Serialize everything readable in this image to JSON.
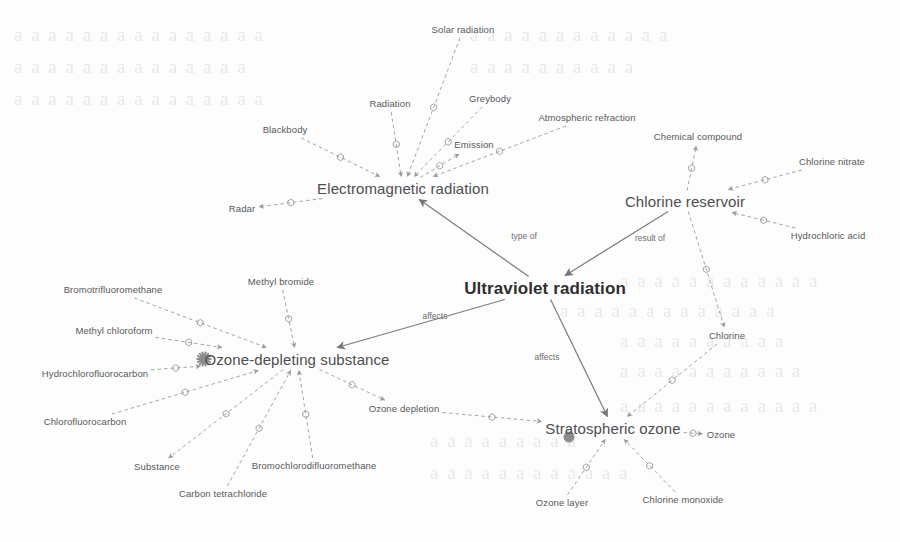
{
  "canvas": {
    "width": 900,
    "height": 542,
    "background": "#fdfdfd"
  },
  "palette": {
    "edge": "#9a9a9c",
    "edge_solid": "#7d7d80",
    "node_text": "#58585a",
    "hub_text": "#2f2f31",
    "edge_label": "#6d6d70",
    "hub_marker": "#8c8c8e",
    "bleed_text": "#b9b6b2"
  },
  "graph": {
    "type": "concept-map",
    "nodes": [
      {
        "id": "solar-radiation",
        "label": "Solar radiation",
        "x": 463,
        "y": 30,
        "tier": "small"
      },
      {
        "id": "radiation",
        "label": "Radiation",
        "x": 390,
        "y": 104,
        "tier": "small"
      },
      {
        "id": "greybody",
        "label": "Greybody",
        "x": 490,
        "y": 99,
        "tier": "small"
      },
      {
        "id": "blackbody",
        "label": "Blackbody",
        "x": 285,
        "y": 130,
        "tier": "small"
      },
      {
        "id": "emission",
        "label": "Emission",
        "x": 474,
        "y": 145,
        "tier": "small"
      },
      {
        "id": "atmospheric-refraction",
        "label": "Atmospheric refraction",
        "x": 587,
        "y": 118,
        "tier": "small"
      },
      {
        "id": "chemical-compound",
        "label": "Chemical compound",
        "x": 698,
        "y": 137,
        "tier": "small"
      },
      {
        "id": "chlorine-nitrate",
        "label": "Chlorine nitrate",
        "x": 832,
        "y": 162,
        "tier": "small"
      },
      {
        "id": "hydrochloric-acid",
        "label": "Hydrochloric acid",
        "x": 828,
        "y": 236,
        "tier": "small"
      },
      {
        "id": "radar",
        "label": "Radar",
        "x": 242,
        "y": 209,
        "tier": "small"
      },
      {
        "id": "electromagnetic-radiation",
        "label": "Electromagnetic radiation",
        "x": 403,
        "y": 188,
        "tier": "main"
      },
      {
        "id": "chlorine-reservoir",
        "label": "Chlorine reservoir",
        "x": 685,
        "y": 201,
        "tier": "main"
      },
      {
        "id": "ultraviolet-radiation",
        "label": "Ultraviolet radiation",
        "x": 545,
        "y": 288,
        "tier": "hub"
      },
      {
        "id": "bromotrifluoromethane",
        "label": "Bromotrifluoromethane",
        "x": 113,
        "y": 290,
        "tier": "small"
      },
      {
        "id": "methyl-bromide",
        "label": "Methyl bromide",
        "x": 281,
        "y": 282,
        "tier": "small"
      },
      {
        "id": "methyl-chloroform",
        "label": "Methyl chloroform",
        "x": 114,
        "y": 331,
        "tier": "small"
      },
      {
        "id": "hydrochlorofluorocarbon",
        "label": "Hydrochlorofluorocarbon",
        "x": 95,
        "y": 374,
        "tier": "small"
      },
      {
        "id": "chlorofluorocarbon",
        "label": "Chlorofluorocarbon",
        "x": 85,
        "y": 422,
        "tier": "small"
      },
      {
        "id": "ozone-depleting-substance",
        "label": "Ozone-depleting substance",
        "x": 297,
        "y": 359,
        "tier": "main"
      },
      {
        "id": "chlorine",
        "label": "Chlorine",
        "x": 727,
        "y": 336,
        "tier": "small"
      },
      {
        "id": "substance",
        "label": "Substance",
        "x": 157,
        "y": 467,
        "tier": "small"
      },
      {
        "id": "carbon-tetrachloride",
        "label": "Carbon tetrachloride",
        "x": 223,
        "y": 494,
        "tier": "small"
      },
      {
        "id": "bromochlorodifluoromethane",
        "label": "Bromochlorodifluoromethane",
        "x": 314,
        "y": 466,
        "tier": "small"
      },
      {
        "id": "ozone-depletion",
        "label": "Ozone depletion",
        "x": 404,
        "y": 409,
        "tier": "small"
      },
      {
        "id": "stratospheric-ozone",
        "label": "Stratospheric ozone",
        "x": 613,
        "y": 428,
        "tier": "main"
      },
      {
        "id": "ozone",
        "label": "Ozone",
        "x": 721,
        "y": 435,
        "tier": "small"
      },
      {
        "id": "ozone-layer",
        "label": "Ozone layer",
        "x": 562,
        "y": 503,
        "tier": "small"
      },
      {
        "id": "chlorine-monoxide",
        "label": "Chlorine monoxide",
        "x": 683,
        "y": 500,
        "tier": "small"
      }
    ],
    "edge_labels": [
      {
        "id": "type-of",
        "label": "type of",
        "x": 524,
        "y": 236
      },
      {
        "id": "result-of",
        "label": "result of",
        "x": 650,
        "y": 238
      },
      {
        "id": "affects-ods",
        "label": "affects",
        "x": 435,
        "y": 316
      },
      {
        "id": "affects-ozone",
        "label": "affects",
        "x": 547,
        "y": 357
      }
    ],
    "edges": [
      {
        "from": "solar-radiation",
        "to": "electromagnetic-radiation",
        "style": "dashed",
        "arrow": true
      },
      {
        "from": "radiation",
        "to": "electromagnetic-radiation",
        "style": "dashed",
        "arrow": true
      },
      {
        "from": "greybody",
        "to": "electromagnetic-radiation",
        "style": "dashed",
        "arrow": true
      },
      {
        "from": "blackbody",
        "to": "electromagnetic-radiation",
        "style": "dashed",
        "arrow": true
      },
      {
        "from": "electromagnetic-radiation",
        "to": "emission",
        "style": "dashed",
        "arrow": true
      },
      {
        "from": "electromagnetic-radiation",
        "to": "radar",
        "style": "dashed",
        "arrow": true
      },
      {
        "from": "atmospheric-refraction",
        "to": "electromagnetic-radiation",
        "style": "dashed",
        "arrow": true
      },
      {
        "from": "chlorine-reservoir",
        "to": "chemical-compound",
        "style": "dashed",
        "arrow": true
      },
      {
        "from": "chlorine-nitrate",
        "to": "chlorine-reservoir",
        "style": "dashed",
        "arrow": true
      },
      {
        "from": "hydrochloric-acid",
        "to": "chlorine-reservoir",
        "style": "dashed",
        "arrow": true
      },
      {
        "from": "ultraviolet-radiation",
        "to": "electromagnetic-radiation",
        "style": "solid",
        "arrow": true,
        "label": "type of"
      },
      {
        "from": "chlorine-reservoir",
        "to": "ultraviolet-radiation",
        "style": "solid",
        "arrow": true,
        "label": "result of"
      },
      {
        "from": "ultraviolet-radiation",
        "to": "ozone-depleting-substance",
        "style": "solid",
        "arrow": true,
        "label": "affects"
      },
      {
        "from": "ultraviolet-radiation",
        "to": "stratospheric-ozone",
        "style": "solid",
        "arrow": true,
        "label": "affects"
      },
      {
        "from": "bromotrifluoromethane",
        "to": "ozone-depleting-substance",
        "style": "dashed",
        "arrow": true
      },
      {
        "from": "methyl-bromide",
        "to": "ozone-depleting-substance",
        "style": "dashed",
        "arrow": true
      },
      {
        "from": "methyl-chloroform",
        "to": "ozone-depleting-substance",
        "style": "dashed",
        "arrow": true
      },
      {
        "from": "hydrochlorofluorocarbon",
        "to": "ozone-depleting-substance",
        "style": "dashed",
        "arrow": true
      },
      {
        "from": "chlorofluorocarbon",
        "to": "ozone-depleting-substance",
        "style": "dashed",
        "arrow": true
      },
      {
        "from": "ozone-depleting-substance",
        "to": "substance",
        "style": "dashed",
        "arrow": true
      },
      {
        "from": "carbon-tetrachloride",
        "to": "ozone-depleting-substance",
        "style": "dashed",
        "arrow": true
      },
      {
        "from": "bromochlorodifluoromethane",
        "to": "ozone-depleting-substance",
        "style": "dashed",
        "arrow": true
      },
      {
        "from": "ozone-depleting-substance",
        "to": "ozone-depletion",
        "style": "dashed",
        "arrow": true
      },
      {
        "from": "ozone-depletion",
        "to": "stratospheric-ozone",
        "style": "dashed",
        "arrow": true
      },
      {
        "from": "chlorine-reservoir",
        "to": "chlorine",
        "style": "dashed",
        "arrow": true
      },
      {
        "from": "chlorine",
        "to": "stratospheric-ozone",
        "style": "dashed",
        "arrow": true
      },
      {
        "from": "stratospheric-ozone",
        "to": "ozone",
        "style": "dashed",
        "arrow": true
      },
      {
        "from": "ozone-layer",
        "to": "stratospheric-ozone",
        "style": "dashed",
        "arrow": true
      },
      {
        "from": "chlorine-monoxide",
        "to": "stratospheric-ozone",
        "style": "dashed",
        "arrow": true
      }
    ]
  },
  "background_bleed": {
    "note": "faint show-through text from reverse of scanned page, illegible",
    "lines": [
      {
        "text": "a a a a a a a a  a a a a a a a",
        "x": 14,
        "y": 24
      },
      {
        "text": "a a a a  a a a a a a a a a a",
        "x": 14,
        "y": 56
      },
      {
        "text": "a a a a a a a a a a a a a a a",
        "x": 14,
        "y": 88
      },
      {
        "text": "a a a a a a a a a a a a",
        "x": 470,
        "y": 24
      },
      {
        "text": "a a a a a a a a a a",
        "x": 470,
        "y": 56
      },
      {
        "text": "a a a a a a a a a a a a",
        "x": 620,
        "y": 270
      },
      {
        "text": "a a a a a a a a a a a a a",
        "x": 560,
        "y": 300
      },
      {
        "text": "a a a a a a a a a a",
        "x": 620,
        "y": 330
      },
      {
        "text": "a a a a a a a a a a a",
        "x": 620,
        "y": 360
      },
      {
        "text": "a a a a a a a a a a a a",
        "x": 620,
        "y": 395
      },
      {
        "text": "a a a a a a a a a",
        "x": 430,
        "y": 430
      },
      {
        "text": "a a a a a a a a a a a a",
        "x": 430,
        "y": 462
      }
    ]
  }
}
